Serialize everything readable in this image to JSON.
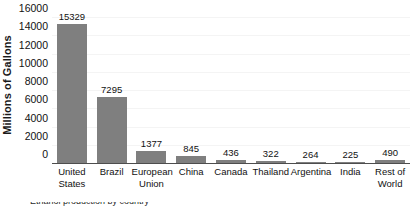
{
  "chart_data": {
    "type": "bar",
    "title": "",
    "xlabel": "",
    "ylabel": "Millions of Gallons",
    "ylim": [
      0,
      16000
    ],
    "grid": true,
    "legend": false,
    "bar_color": "#7f7f7f",
    "background_color": "#ffffff",
    "axis_color": "#4d4d4d",
    "categories": [
      "United States",
      "Brazil",
      "European Union",
      "China",
      "Canada",
      "Thailand",
      "Argentina",
      "India",
      "Rest of World"
    ],
    "category_lines": [
      [
        "United",
        "States"
      ],
      [
        "Brazil",
        ""
      ],
      [
        "European",
        "Union"
      ],
      [
        "China",
        ""
      ],
      [
        "Canada",
        ""
      ],
      [
        "Thailand",
        ""
      ],
      [
        "Argentina",
        ""
      ],
      [
        "India",
        ""
      ],
      [
        "Rest of",
        "World"
      ]
    ],
    "values": [
      15329,
      7295,
      1377,
      845,
      436,
      322,
      264,
      225,
      490
    ],
    "value_labels": [
      "15329",
      "7295",
      "1377",
      "845",
      "436",
      "322",
      "264",
      "225",
      "490"
    ],
    "y_ticks": [
      0,
      2000,
      4000,
      6000,
      8000,
      10000,
      12000,
      14000,
      16000
    ],
    "y_tick_labels": [
      "0",
      "2000",
      "4000",
      "6000",
      "8000",
      "10000",
      "12000",
      "14000",
      "16000"
    ]
  },
  "caption": {
    "cut_off_text": "Ethanol production by country"
  }
}
